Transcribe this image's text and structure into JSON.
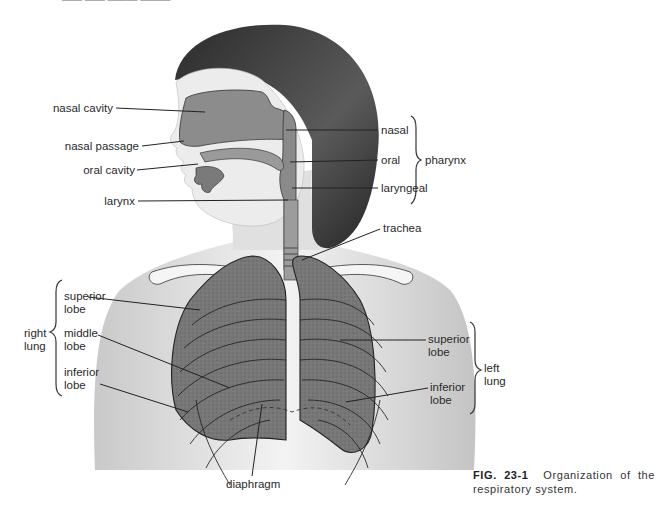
{
  "figure": {
    "title": "Organization of the respiratory system",
    "header_fragment": "—— ——  ———  ———"
  },
  "labels": {
    "left_head": [
      {
        "id": "nasal_cavity",
        "text": "nasal cavity"
      },
      {
        "id": "nasal_passage",
        "text": "nasal passage"
      },
      {
        "id": "oral_cavity",
        "text": "oral cavity"
      },
      {
        "id": "larynx",
        "text": "larynx"
      }
    ],
    "pharynx": {
      "group_label": "pharynx",
      "parts": [
        {
          "id": "nasal",
          "text": "nasal"
        },
        {
          "id": "oral",
          "text": "oral"
        },
        {
          "id": "laryngeal",
          "text": "laryngeal"
        }
      ]
    },
    "trachea": "trachea",
    "right_lung": {
      "group_label_line1": "right",
      "group_label_line2": "lung",
      "lobes": [
        {
          "line1": "superior",
          "line2": "lobe"
        },
        {
          "line1": "middle",
          "line2": "lobe"
        },
        {
          "line1": "inferior",
          "line2": "lobe"
        }
      ]
    },
    "left_lung": {
      "group_label_line1": "left",
      "group_label_line2": "lung",
      "lobes": [
        {
          "line1": "superior",
          "line2": "lobe"
        },
        {
          "line1": "inferior",
          "line2": "lobe"
        }
      ]
    },
    "diaphragm": "diaphragm"
  },
  "caption": {
    "number": "FIG. 23-1",
    "text": "Organization of the respiratory system."
  },
  "colors": {
    "skin": "#e6e6e6",
    "hair": "#3a3a3a",
    "airway": "#8a8a8a",
    "lung": "#6f6f6f",
    "bone": "#f2f2f2",
    "line": "#2a2a2a"
  }
}
